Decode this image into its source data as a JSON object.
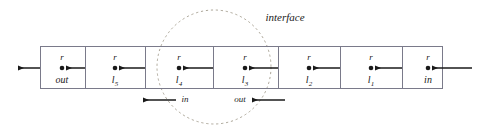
{
  "figure": {
    "title_label": "interface",
    "stroke_color": "#1a1a1a",
    "box_border_color": "#7a7a8a",
    "circle_color": "#a09a8a"
  },
  "cells": [
    {
      "id": "cell-out",
      "r_label": "r",
      "name_base": "out",
      "name_sub": "",
      "cx": 62,
      "left": 40,
      "right": 85
    },
    {
      "id": "cell-l5",
      "r_label": "r",
      "name_base": "l",
      "name_sub": "5",
      "cx": 115,
      "left": 85,
      "right": 145
    },
    {
      "id": "cell-l4",
      "r_label": "r",
      "name_base": "l",
      "name_sub": "4",
      "cx": 179,
      "left": 145,
      "right": 213
    },
    {
      "id": "cell-l3",
      "r_label": "r",
      "name_base": "l",
      "name_sub": "3",
      "cx": 245,
      "left": 213,
      "right": 278
    },
    {
      "id": "cell-l2",
      "r_label": "r",
      "name_base": "l",
      "name_sub": "2",
      "cx": 309,
      "left": 278,
      "right": 340
    },
    {
      "id": "cell-l1",
      "r_label": "r",
      "name_base": "l",
      "name_sub": "1",
      "cx": 371,
      "left": 340,
      "right": 403
    },
    {
      "id": "cell-in",
      "r_label": "r",
      "name_base": "in",
      "name_sub": "",
      "cx": 428,
      "left": 403,
      "right": 443
    }
  ],
  "flow_arrows": {
    "in_label": "in",
    "out_label": "out"
  },
  "axis": {
    "box_left": 40,
    "box_right": 443,
    "box_top": 46,
    "box_bottom": 89,
    "midline_y": 68
  },
  "interface_circle": {
    "cx": 214,
    "cy": 67,
    "r": 57
  }
}
